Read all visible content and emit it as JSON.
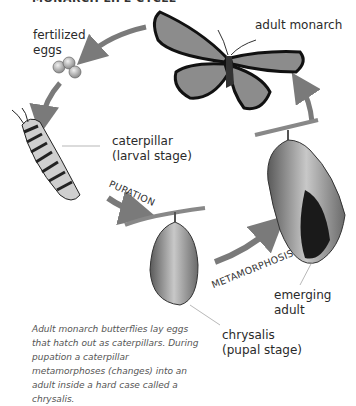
{
  "title": "MONARCH LIFE CYCLE",
  "labels": {
    "eggs": "fertilized\neggs",
    "eggs_line1": "fertilized",
    "eggs_line2": "eggs",
    "adult": "adult monarch",
    "caterpillar_line1": "caterpillar",
    "caterpillar_line2": "(larval stage)",
    "chrysalis_line1": "chrysalis",
    "chrysalis_line2": "(pupal stage)",
    "emerging_line1": "emerging",
    "emerging_line2": "adult"
  },
  "stages": {
    "pupation": "PUPATION",
    "metamorphosis": "METAMORPHOSIS"
  },
  "caption": "Adult monarch butterflies lay eggs that hatch out as caterpillars. During pupation a caterpillar metamorphoses (changes) into an adult inside a hard case called a chrysalis.",
  "colors": {
    "arrow": "#7a7a7a",
    "text": "#2a2a2a",
    "caption": "#555555"
  }
}
